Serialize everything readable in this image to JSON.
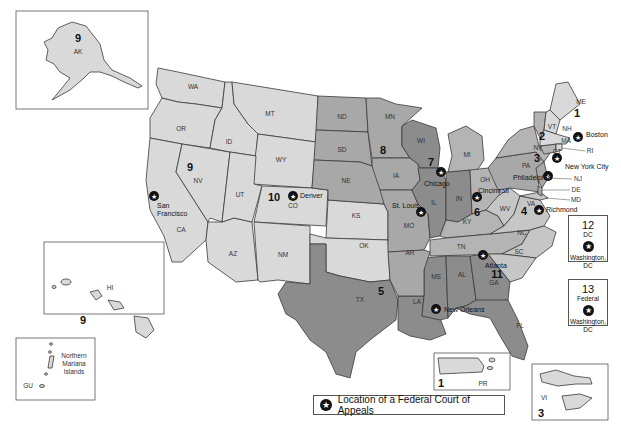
{
  "legend": {
    "icon": "star-circle-icon",
    "label": "Location of a Federal Court of Appeals"
  },
  "colors": {
    "light": "#d9d9d9",
    "mid": "#a8a8a8",
    "dark": "#8c8c8c",
    "border": "#3a3a3a"
  },
  "circuits": [
    {
      "number": "1",
      "states": [
        "ME",
        "NH",
        "MA",
        "RI",
        "PR"
      ],
      "court_city": "Boston"
    },
    {
      "number": "2",
      "states": [
        "VT",
        "NY",
        "CT"
      ],
      "court_city": "New York City"
    },
    {
      "number": "3",
      "states": [
        "PA",
        "NJ",
        "DE",
        "VI"
      ],
      "court_city": "Philadelphia"
    },
    {
      "number": "4",
      "states": [
        "MD",
        "WV",
        "VA",
        "NC",
        "SC"
      ],
      "court_city": "Richmond"
    },
    {
      "number": "5",
      "states": [
        "TX",
        "LA",
        "MS"
      ],
      "court_city": "New Orleans"
    },
    {
      "number": "6",
      "states": [
        "MI",
        "OH",
        "KY",
        "TN"
      ],
      "court_city": "Cincinnati"
    },
    {
      "number": "7",
      "states": [
        "WI",
        "IL",
        "IN"
      ],
      "court_city": "Chicago"
    },
    {
      "number": "8",
      "states": [
        "ND",
        "SD",
        "NE",
        "MN",
        "IA",
        "MO",
        "AR"
      ],
      "court_city": "St. Louis"
    },
    {
      "number": "9",
      "states": [
        "WA",
        "OR",
        "CA",
        "NV",
        "ID",
        "MT",
        "AZ",
        "AK",
        "HI",
        "GU",
        "Northern Mariana Islands"
      ],
      "court_city": "San Francisco"
    },
    {
      "number": "10",
      "states": [
        "WY",
        "UT",
        "CO",
        "KS",
        "OK",
        "NM"
      ],
      "court_city": "Denver"
    },
    {
      "number": "11",
      "states": [
        "AL",
        "GA",
        "FL"
      ],
      "court_city": "Atlanta"
    },
    {
      "number": "12",
      "states": [
        "DC"
      ],
      "court_city": "Washington, DC"
    },
    {
      "number": "13",
      "states": [
        "Federal"
      ],
      "court_city": "Washington, DC"
    }
  ],
  "labels": {
    "states": {
      "WA": "WA",
      "OR": "OR",
      "CA": "CA",
      "NV": "NV",
      "ID": "ID",
      "MT": "MT",
      "WY": "WY",
      "UT": "UT",
      "CO": "CO",
      "AZ": "AZ",
      "NM": "NM",
      "ND": "ND",
      "SD": "SD",
      "NE": "NE",
      "KS": "KS",
      "OK": "OK",
      "TX": "TX",
      "MN": "MN",
      "IA": "IA",
      "MO": "MO",
      "AR": "AR",
      "LA": "LA",
      "WI": "WI",
      "IL": "IL",
      "IN": "IN",
      "MI": "MI",
      "OH": "OH",
      "KY": "KY",
      "TN": "TN",
      "MS": "MS",
      "AL": "AL",
      "GA": "GA",
      "FL": "FL",
      "SC": "SC",
      "NC": "NC",
      "VA": "VA",
      "WV": "WV",
      "PA": "PA",
      "NY": "NY",
      "VT": "VT",
      "NH": "NH",
      "ME": "ME",
      "MA": "MA",
      "RI": "RI",
      "CT": "CT",
      "NJ": "NJ",
      "DE": "DE",
      "MD": "MD",
      "AK": "AK",
      "HI": "HI",
      "PR": "PR",
      "VI": "VI",
      "GU": "GU"
    },
    "cities": {
      "san_francisco": [
        "San",
        "Francisco"
      ],
      "denver": "Denver",
      "st_louis": "St. Louis",
      "chicago": "Chicago",
      "cincinnati": "Cincinnati",
      "atlanta": "Atlanta",
      "new_orleans": "New Orleans",
      "richmond": "Richmond",
      "philadelphia": "Philadelphia",
      "new_york": "New York City",
      "boston": "Boston"
    },
    "circuit_numbers": {
      "c1": "1",
      "c2": "2",
      "c3": "3",
      "c4": "4",
      "c5": "5",
      "c6": "6",
      "c7": "7",
      "c8": "8",
      "c9": "9",
      "c10": "10",
      "c11": "11"
    },
    "nmi": [
      "Northern",
      "Mariana",
      "Islands"
    ]
  },
  "insets": {
    "alaska": {
      "circuit": "9",
      "state": "AK"
    },
    "hawaii": {
      "circuit": "9",
      "state": "HI"
    },
    "nmi": {
      "lines": [
        "Northern",
        "Mariana",
        "Islands"
      ],
      "territory": "GU"
    },
    "puerto_rico": {
      "circuit": "1",
      "territory": "PR"
    },
    "virgin_islands": {
      "circuit": "3",
      "territory": "VI"
    },
    "dc": {
      "circuit": "12",
      "label": "DC",
      "city_line1": "Washington,",
      "city_line2": "DC"
    },
    "federal": {
      "circuit": "13",
      "label": "Federal",
      "city_line1": "Washington,",
      "city_line2": "DC"
    }
  }
}
